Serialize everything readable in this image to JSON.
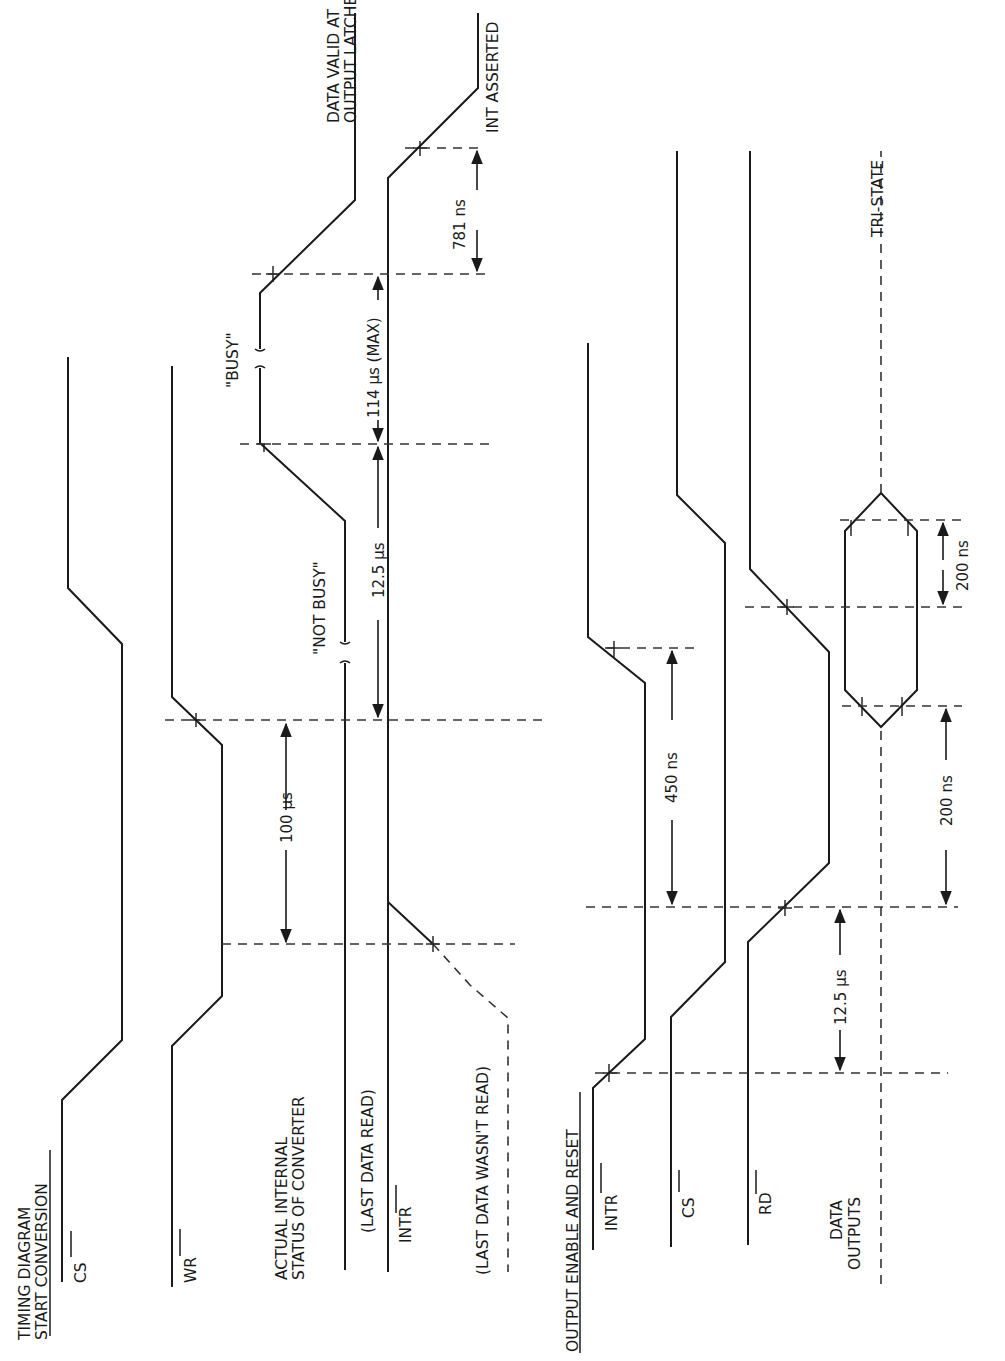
{
  "diagram": {
    "title_start": [
      "TIMING DIAGRAM",
      "START CONVERSION"
    ],
    "title_output": "OUTPUT ENABLE AND RESET",
    "start_section": {
      "signals": {
        "cs": "CS",
        "wr": "WR",
        "status": [
          "ACTUAL INTERNAL",
          "STATUS OF CONVERTER"
        ],
        "last_read": "(LAST DATA READ)",
        "intr": "INTR",
        "last_not_read": "(LAST DATA WASN'T READ)"
      },
      "annotations": {
        "not_busy": "\"NOT BUSY\"",
        "busy": "\"BUSY\"",
        "data_valid": [
          "DATA VALID AT",
          "OUTPUT LATCHES"
        ],
        "int_asserted": "INT ASSERTED"
      },
      "timings": {
        "t_100us": "100 µs",
        "t_12_5us": "12.5 µs",
        "t_114us": "114 µs (MAX)",
        "t_781ns": "781 ns"
      }
    },
    "output_section": {
      "signals": {
        "intr": "INTR",
        "cs": "CS",
        "rd": "RD",
        "data_outputs": [
          "DATA",
          "OUTPUTS"
        ]
      },
      "annotations": {
        "tri_state": "TRI-STATE"
      },
      "timings": {
        "t_450ns": "450 ns",
        "t_200ns_a": "200 ns",
        "t_200ns_b": "200 ns",
        "t_12_5us": "12.5 µs"
      }
    },
    "orientation": "rotated 90° counter-clockwise (time axis runs bottom to top)"
  }
}
